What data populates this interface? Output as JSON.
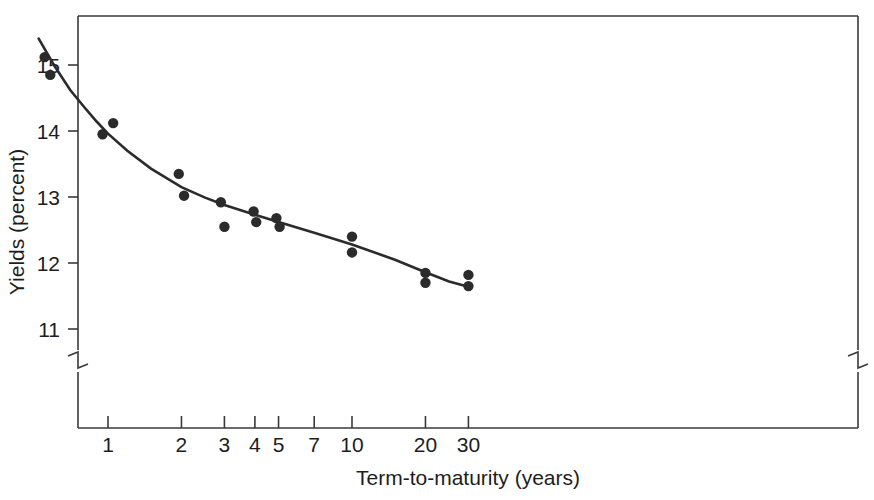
{
  "chart_data": {
    "type": "scatter",
    "title": "",
    "xlabel": "Term-to-maturity (years)",
    "ylabel": "Yields (percent)",
    "xscale": "log",
    "xlim": [
      0.5,
      30
    ],
    "ylim": [
      10.55,
      15.55
    ],
    "grid": false,
    "legend": null,
    "axis_breaks": {
      "y_axis_break_below": 10.8,
      "x_axis_break_note": "break symbol on left and right vertical frame below plotted range"
    },
    "xticks": [
      1,
      2,
      3,
      4,
      5,
      7,
      10,
      20,
      30
    ],
    "xtick_labels": [
      "1",
      "2",
      "3",
      "4",
      "5",
      "7",
      "10",
      "20",
      "30"
    ],
    "yticks": [
      11,
      12,
      13,
      14,
      15
    ],
    "ytick_labels": [
      "11",
      "12",
      "13",
      "14",
      "15"
    ],
    "series": [
      {
        "name": "Observed yields",
        "type": "scatter",
        "marker": "filled-circle",
        "color": "#2b2b2b",
        "points": [
          {
            "x": 0.55,
            "y": 15.12
          },
          {
            "x": 0.58,
            "y": 14.85
          },
          {
            "x": 1.05,
            "y": 14.12
          },
          {
            "x": 0.95,
            "y": 13.95
          },
          {
            "x": 1.95,
            "y": 13.35
          },
          {
            "x": 2.05,
            "y": 13.02
          },
          {
            "x": 2.9,
            "y": 12.92
          },
          {
            "x": 3.0,
            "y": 12.55
          },
          {
            "x": 3.95,
            "y": 12.78
          },
          {
            "x": 4.05,
            "y": 12.62
          },
          {
            "x": 4.9,
            "y": 12.68
          },
          {
            "x": 5.05,
            "y": 12.55
          },
          {
            "x": 10.0,
            "y": 12.4
          },
          {
            "x": 10.0,
            "y": 12.16
          },
          {
            "x": 20.0,
            "y": 11.85
          },
          {
            "x": 20.0,
            "y": 11.7
          },
          {
            "x": 30.0,
            "y": 11.82
          },
          {
            "x": 30.0,
            "y": 11.65
          }
        ]
      },
      {
        "name": "Fitted yield curve",
        "type": "line",
        "color": "#2b2b2b",
        "points": [
          {
            "x": 0.52,
            "y": 15.4
          },
          {
            "x": 0.6,
            "y": 15.0
          },
          {
            "x": 0.7,
            "y": 14.62
          },
          {
            "x": 0.8,
            "y": 14.36
          },
          {
            "x": 0.9,
            "y": 14.14
          },
          {
            "x": 1.0,
            "y": 13.96
          },
          {
            "x": 1.2,
            "y": 13.7
          },
          {
            "x": 1.5,
            "y": 13.43
          },
          {
            "x": 2.0,
            "y": 13.15
          },
          {
            "x": 2.5,
            "y": 12.99
          },
          {
            "x": 3.0,
            "y": 12.88
          },
          {
            "x": 4.0,
            "y": 12.73
          },
          {
            "x": 5.0,
            "y": 12.62
          },
          {
            "x": 7.0,
            "y": 12.46
          },
          {
            "x": 10.0,
            "y": 12.28
          },
          {
            "x": 15.0,
            "y": 12.05
          },
          {
            "x": 20.0,
            "y": 11.86
          },
          {
            "x": 25.0,
            "y": 11.72
          },
          {
            "x": 30.0,
            "y": 11.64
          }
        ]
      }
    ]
  },
  "figure": {
    "background_color": "#ffffff",
    "ink_color": "#2b2b2b"
  }
}
